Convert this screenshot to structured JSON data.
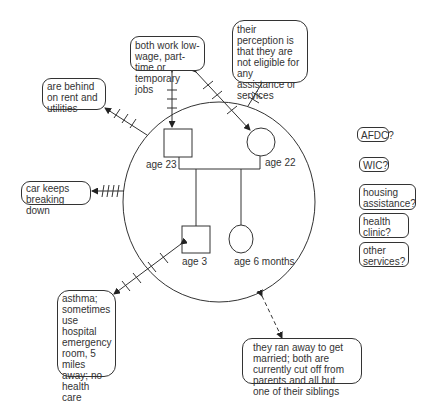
{
  "diagram": {
    "type": "ecomap",
    "family": {
      "father": {
        "symbol": "square",
        "label": "age 23"
      },
      "mother": {
        "symbol": "circle",
        "label": "age 22"
      },
      "son": {
        "symbol": "square",
        "label": "age 3"
      },
      "daughter": {
        "symbol": "circle",
        "label": "age 6 months"
      }
    },
    "external_boxes": {
      "jobs": "both work low-wage, part-time or temporary jobs",
      "perception": "their perception is that they are not eligible for any assistance or services",
      "rent": "are behind on rent and utilities",
      "car": "car keeps breaking down",
      "asthma": "asthma; sometimes use hospital emergency room, 5 miles away; no health care coverage",
      "ranaway": "they ran away to get married; both are currently cut off from parents and all but one of their siblings"
    },
    "services": [
      {
        "label": "AFDC?"
      },
      {
        "label": "WIC?"
      },
      {
        "label": "housing assistance?"
      },
      {
        "label": "health clinic?"
      },
      {
        "label": "other services?"
      }
    ]
  }
}
